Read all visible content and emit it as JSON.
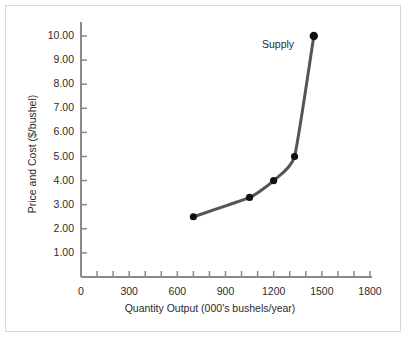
{
  "chart_data": {
    "type": "line",
    "title": "",
    "xlabel": "Quantity Output (000's bushels/year)",
    "ylabel": "Price and Cost ($/bushel)",
    "xlim": [
      0,
      1800
    ],
    "ylim": [
      0,
      10
    ],
    "grid": false,
    "legend_position": "inline-annotation",
    "x_ticks": [
      "0",
      "300",
      "600",
      "900",
      "1200",
      "1500",
      "1800"
    ],
    "x_tick_values": [
      0,
      300,
      600,
      900,
      1200,
      1500,
      1800
    ],
    "x_minor_tick_step": 100,
    "y_ticks": [
      "1.00",
      "2.00",
      "3.00",
      "4.00",
      "5.00",
      "6.00",
      "7.00",
      "8.00",
      "9.00",
      "10.00"
    ],
    "y_tick_values": [
      1,
      2,
      3,
      4,
      5,
      6,
      7,
      8,
      9,
      10
    ],
    "series": [
      {
        "name": "Supply",
        "annotation": "Supply",
        "color": "#555555",
        "marker_color": "#111111",
        "x": [
          700,
          1050,
          1200,
          1330,
          1450
        ],
        "values": [
          2.5,
          3.3,
          4.0,
          5.0,
          10.0
        ]
      }
    ]
  },
  "axis": {
    "line_color": "#8a8a8a",
    "text_color": "#2b2b2b"
  },
  "frame": {
    "border_color": "#d8d8d8",
    "background": "#ffffff"
  }
}
